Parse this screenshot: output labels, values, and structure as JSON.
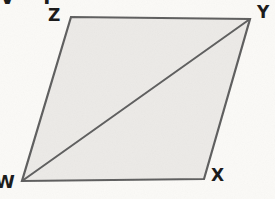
{
  "figure": {
    "type": "parallelogram-with-diagonal",
    "vertex_labels": {
      "top_left": "Z",
      "top_right": "Y",
      "bottom_left": "W",
      "bottom_right": "X"
    },
    "shape": {
      "polygon_points": "71,17 250,19 204,179 22,181",
      "diagonal_path": "M22,181 L250,19",
      "diagonal_endpoints": "W to Y"
    },
    "cropped_text_fragment": "V I"
  },
  "colors": {
    "background": "#fbfaf7",
    "shape-fill": "#eceae7",
    "shape-stroke": "#5d5d5d",
    "label-color": "#171717"
  }
}
